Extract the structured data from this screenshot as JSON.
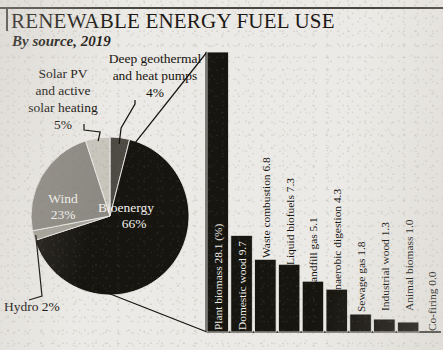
{
  "header": {
    "title": "RENEWABLE ENERGY FUEL USE",
    "subtitle": "By source, 2019"
  },
  "colors": {
    "paper": "#eceae6",
    "ink": "#15130f",
    "bioenergy": "#17150f",
    "wind": "#8d8a83",
    "solar": "#c8c5bd",
    "geothermal": "#4e4b45",
    "hydro": "#a5a29a",
    "bar_fill": "#17150f",
    "axis": "#15130f"
  },
  "pie": {
    "name": "renewable-energy-source-share",
    "unit": "%",
    "center": {
      "x": 110,
      "y": 216
    },
    "radius": 79,
    "slices": [
      {
        "name": "bioenergy",
        "label": "Bioenergy",
        "value_label": "66%",
        "value": 66,
        "color": "#17150f",
        "label_x": 126,
        "label_y": 212,
        "value_x": 134,
        "value_y": 228,
        "label_anchor": "middle",
        "label_class": "onpie"
      },
      {
        "name": "wind",
        "label": "Wind",
        "value_label": "23%",
        "value": 23,
        "color": "#8d8a83",
        "label_x": 63,
        "label_y": 203,
        "value_x": 63,
        "value_y": 219,
        "label_anchor": "middle",
        "label_class": "onpie"
      },
      {
        "name": "solar-pv-and-active-solar-heating",
        "label": "Solar PV and active solar heating",
        "value_label": "5%",
        "value": 5,
        "color": "#c8c5bd",
        "label_anchor": "middle",
        "label_class": "outside"
      },
      {
        "name": "deep-geothermal-and-heat-pumps",
        "label": "Deep geothermal and heat pumps",
        "value_label": "4%",
        "value": 4,
        "color": "#4e4b45",
        "label_anchor": "middle",
        "label_class": "outside"
      },
      {
        "name": "hydro",
        "label": "Hydro",
        "value_label": "2%",
        "value": 2,
        "color": "#a5a29a",
        "label_anchor": "start",
        "label_class": "outside"
      }
    ],
    "callouts": [
      {
        "name": "solar-pv-callout",
        "lines": [
          "Solar PV",
          "and active",
          "solar heating",
          "5%"
        ],
        "x": 63,
        "y": 78,
        "line_height": 17,
        "anchor": "middle"
      },
      {
        "name": "deep-geothermal-callout",
        "lines": [
          "Deep geothermal",
          "and heat pumps",
          "4%"
        ],
        "x": 155,
        "y": 63,
        "line_height": 17,
        "anchor": "middle"
      },
      {
        "name": "hydro-callout",
        "lines": [
          "Hydro 2%"
        ],
        "x": 4,
        "y": 311,
        "line_height": 16,
        "anchor": "start"
      }
    ]
  },
  "chart_data": {
    "type": "bar",
    "name": "bioenergy-breakdown",
    "title": "RENEWABLE ENERGY FUEL USE",
    "subtitle": "By source, 2019",
    "xlabel": "",
    "ylabel": "",
    "unit": "%",
    "ylim": [
      0,
      28.1
    ],
    "grid": false,
    "legend": false,
    "categories": [
      "Plant biomass",
      "Domestic wood",
      "Waste combustion",
      "Liquid biofuels",
      "Landfill gas",
      "Anaerobic digestion",
      "Sewage gas",
      "Industrial wood",
      "Animal biomass",
      "Co-firing"
    ],
    "values": [
      28.1,
      9.7,
      7.3,
      6.8,
      5.1,
      4.3,
      1.8,
      1.3,
      1.0,
      0.0
    ],
    "bar_labels": [
      "Plant biomass 28.1 (%)",
      "Domestic wood 9.7",
      "Waste combustion 6.8",
      "Liquid biofuels 7.3",
      "Landfill gas 5.1",
      "Anaerobic digestion 4.3",
      "Sewage gas 1.8",
      "Industrial wood 1.3",
      "Animal biomass 1.0",
      "Co-firing 0.0"
    ],
    "pie_companion": {
      "categories": [
        "Bioenergy",
        "Wind",
        "Solar PV and active solar heating",
        "Deep geothermal and heat pumps",
        "Hydro"
      ],
      "values": [
        66,
        23,
        5,
        4,
        2
      ]
    }
  },
  "bar_geometry": {
    "baseline_y": 332,
    "left": 207,
    "bar_width": 21.5,
    "gap": 2.3,
    "top_of_max": 52,
    "label_inside_indices": [
      0,
      1
    ],
    "label_offsets_y": [
      330,
      330,
      258,
      265,
      289,
      298,
      312,
      311,
      311,
      331
    ]
  }
}
